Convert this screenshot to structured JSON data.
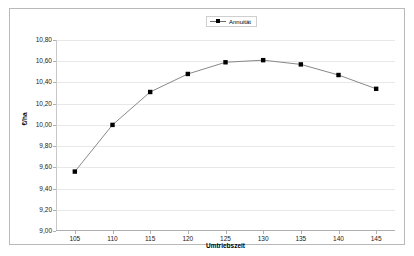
{
  "chart_data": {
    "type": "line",
    "title": "",
    "xlabel": "Umtriebszeit",
    "ylabel": "€/ha",
    "x": [
      105,
      110,
      115,
      120,
      125,
      130,
      135,
      140,
      145
    ],
    "xlim": [
      102.5,
      147.5
    ],
    "ylim": [
      9.0,
      10.8
    ],
    "yticks": [
      "9,00",
      "9,20",
      "9,40",
      "9,60",
      "9,80",
      "10,00",
      "10,20",
      "10,40",
      "10,60",
      "10,80"
    ],
    "ytick_values": [
      9.0,
      9.2,
      9.4,
      9.6,
      9.8,
      10.0,
      10.2,
      10.4,
      10.6,
      10.8
    ],
    "xticks": [
      "105",
      "110",
      "115",
      "120",
      "125",
      "130",
      "135",
      "140",
      "145"
    ],
    "grid": true,
    "legend_position": "top-center",
    "series": [
      {
        "name": "Annuität",
        "values": [
          9.56,
          10.0,
          10.31,
          10.48,
          10.59,
          10.61,
          10.57,
          10.47,
          10.34
        ],
        "marker": "square",
        "marker_color": "#000000",
        "line_color": "#7a7a7a"
      }
    ]
  },
  "legend": {
    "items": [
      {
        "label": "Annuität"
      }
    ]
  },
  "axes": {
    "y_title": "€/ha",
    "x_title": "Umtriebszeit"
  },
  "colors": {
    "frame_border": "#b9b9b9",
    "gridline": "#e8e8e8",
    "axis": "#b0b0b0",
    "line": "#7a7a7a",
    "marker": "#000000",
    "text": "#1a1a1a",
    "background": "#ffffff"
  }
}
